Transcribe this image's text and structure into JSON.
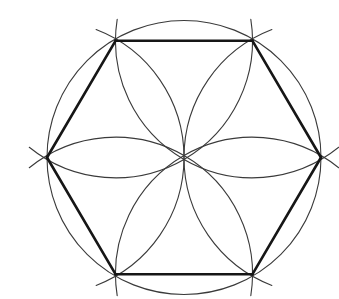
{
  "figure": {
    "kind": "compass-and-straightedge geometric construction",
    "background_color": "#ffffff",
    "canvas": {
      "width": 339,
      "height": 299
    }
  },
  "geometry": {
    "center": {
      "x": 184.0,
      "y": 157.5
    },
    "radius": 137.0,
    "vertex_count": 6,
    "vertex_angles_deg": [
      0,
      60,
      120,
      180,
      240,
      300
    ],
    "vertices": [
      {
        "label": "right",
        "angle_deg": 0,
        "x": 321.0,
        "y": 157.5
      },
      {
        "label": "top-right",
        "angle_deg": 300,
        "x": 252.5,
        "y": 40.8
      },
      {
        "label": "top-left",
        "angle_deg": 240,
        "x": 115.5,
        "y": 40.8
      },
      {
        "label": "left",
        "angle_deg": 180,
        "x": 47.0,
        "y": 157.5
      },
      {
        "label": "bottom-left",
        "angle_deg": 120,
        "x": 115.5,
        "y": 274.2
      },
      {
        "label": "bottom-right",
        "angle_deg": 60,
        "x": 252.5,
        "y": 274.2
      }
    ]
  },
  "outer_circle": {
    "name": "circumscribed-circle",
    "cx": 184.0,
    "cy": 157.5,
    "r": 137.0,
    "stroke_color": "#3a3a3a",
    "stroke_width": 1.1,
    "fill": "none"
  },
  "construction_arcs": {
    "name": "six-petal-rosette-arcs",
    "description": "Six arcs of radius equal to the circle radius, each centered on one hexagon vertex, sweeping through the circle center to form a six-petal rosette.",
    "count": 6,
    "arc_radius": 137.0,
    "arc_span_deg": 138,
    "stroke_color": "#3a3a3a",
    "stroke_width": 1.1,
    "arcs": [
      {
        "center_vertex": "right",
        "cx": 321.0,
        "cy": 157.5,
        "bisector_deg": 180
      },
      {
        "center_vertex": "top-right",
        "cx": 252.5,
        "cy": 40.8,
        "bisector_deg": 120
      },
      {
        "center_vertex": "top-left",
        "cx": 115.5,
        "cy": 40.8,
        "bisector_deg": 60
      },
      {
        "center_vertex": "left",
        "cx": 47.0,
        "cy": 157.5,
        "bisector_deg": 0
      },
      {
        "center_vertex": "bottom-left",
        "cx": 115.5,
        "cy": 274.2,
        "bisector_deg": 300
      },
      {
        "center_vertex": "bottom-right",
        "cx": 252.5,
        "cy": 274.2,
        "bisector_deg": 240
      }
    ]
  },
  "hexagon": {
    "name": "inscribed-regular-hexagon",
    "side_count": 6,
    "stroke_color": "#161616",
    "stroke_width": 2.6,
    "fill": "none",
    "edges": [
      {
        "from": "top-left",
        "to": "top-right",
        "x1": 115.5,
        "y1": 40.8,
        "x2": 252.5,
        "y2": 40.8
      },
      {
        "from": "top-right",
        "to": "right",
        "x1": 252.5,
        "y1": 40.8,
        "x2": 321.0,
        "y2": 157.5
      },
      {
        "from": "right",
        "to": "bottom-right",
        "x1": 321.0,
        "y1": 157.5,
        "x2": 252.5,
        "y2": 274.2
      },
      {
        "from": "bottom-right",
        "to": "bottom-left",
        "x1": 252.5,
        "y1": 274.2,
        "x2": 115.5,
        "y2": 274.2
      },
      {
        "from": "bottom-left",
        "to": "left",
        "x1": 115.5,
        "y1": 274.2,
        "x2": 47.0,
        "y2": 157.5
      },
      {
        "from": "left",
        "to": "top-left",
        "x1": 47.0,
        "y1": 157.5,
        "x2": 115.5,
        "y2": 40.8
      }
    ]
  },
  "center_point": {
    "name": "rosette-convergence-point",
    "x": 184.0,
    "y": 157.5,
    "description": "All six construction arcs pass through this common point."
  },
  "colors": {
    "background": "#ffffff",
    "thin_line": "#3a3a3a",
    "thick_line": "#161616"
  }
}
